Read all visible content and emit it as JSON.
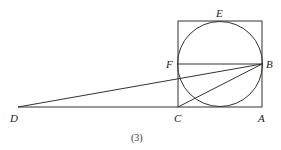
{
  "figure": {
    "caption": "(3)",
    "points": {
      "A": {
        "label": "A",
        "x": 262,
        "y": 107
      },
      "B": {
        "label": "B",
        "x": 262,
        "y": 64
      },
      "C": {
        "label": "C",
        "x": 178,
        "y": 107
      },
      "D": {
        "label": "D",
        "x": 18,
        "y": 107
      },
      "E": {
        "label": "E",
        "x": 220,
        "y": 21
      },
      "F": {
        "label": "F",
        "x": 178,
        "y": 64
      }
    },
    "square": {
      "x": 178,
      "y": 21,
      "w": 84,
      "h": 86
    },
    "circle": {
      "cx": 220,
      "cy": 64,
      "r": 42.5
    },
    "segments": [
      "FB",
      "DB",
      "CB",
      "DC"
    ],
    "stroke_color": "#333333"
  }
}
